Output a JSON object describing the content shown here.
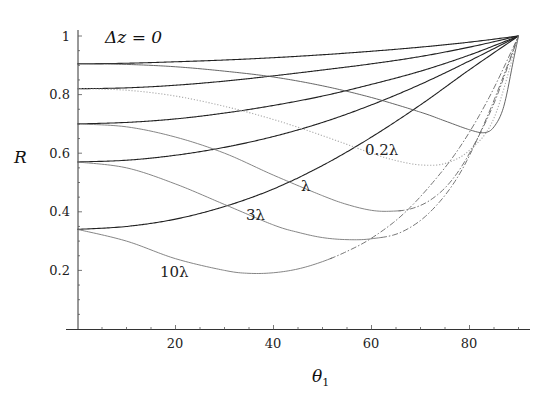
{
  "chart_data": {
    "type": "line",
    "title": "Δz = 0",
    "xlabel": "θ₁",
    "ylabel": "R",
    "xlim": [
      0,
      92
    ],
    "ylim": [
      0,
      1
    ],
    "grid": false,
    "legend": "none (inline curve labels)",
    "x_ticks": [
      20,
      40,
      60,
      80
    ],
    "x_tick_labels": [
      "20",
      "40",
      "60",
      "80"
    ],
    "x_minor_step": 5,
    "y_ticks": [
      0.2,
      0.4,
      0.6,
      0.8,
      1
    ],
    "y_tick_labels": [
      "0.2",
      "0.4",
      "0.6",
      "0.8",
      "1"
    ],
    "y_minor_step": 0.05,
    "annotations": [
      {
        "text": "0.2λ",
        "x": 59,
        "y": 0.61
      },
      {
        "text": "λ",
        "x": 46,
        "y": 0.48
      },
      {
        "text": "3λ",
        "x": 34.5,
        "y": 0.38
      },
      {
        "text": "10λ",
        "x": 17.5,
        "y": 0.19
      }
    ],
    "series": [
      {
        "name": "upper-1",
        "style": "solid",
        "color": "#222222",
        "x": [
          0,
          10,
          20,
          30,
          40,
          50,
          60,
          70,
          80,
          90
        ],
        "y": [
          0.905,
          0.907,
          0.912,
          0.918,
          0.926,
          0.936,
          0.948,
          0.962,
          0.979,
          1.0
        ]
      },
      {
        "name": "upper-2",
        "style": "solid",
        "color": "#222222",
        "x": [
          0,
          10,
          20,
          30,
          40,
          50,
          60,
          70,
          80,
          90
        ],
        "y": [
          0.82,
          0.823,
          0.832,
          0.846,
          0.864,
          0.884,
          0.905,
          0.93,
          0.962,
          1.0
        ]
      },
      {
        "name": "upper-3",
        "style": "solid",
        "color": "#222222",
        "x": [
          0,
          10,
          20,
          30,
          40,
          50,
          60,
          70,
          80,
          90
        ],
        "y": [
          0.7,
          0.705,
          0.717,
          0.737,
          0.763,
          0.795,
          0.835,
          0.88,
          0.935,
          1.0
        ]
      },
      {
        "name": "upper-4",
        "style": "solid",
        "color": "#222222",
        "x": [
          0,
          10,
          20,
          30,
          40,
          50,
          60,
          70,
          80,
          90
        ],
        "y": [
          0.57,
          0.576,
          0.593,
          0.62,
          0.657,
          0.705,
          0.765,
          0.835,
          0.915,
          1.0
        ]
      },
      {
        "name": "upper-5",
        "style": "solid",
        "color": "#222222",
        "x": [
          0,
          10,
          20,
          30,
          40,
          50,
          60,
          70,
          80,
          90
        ],
        "y": [
          0.34,
          0.35,
          0.375,
          0.418,
          0.478,
          0.558,
          0.655,
          0.765,
          0.885,
          1.0
        ]
      },
      {
        "name": "lower-0.2λ-a",
        "label": "",
        "style": "solid",
        "color": "#555555",
        "x": [
          0,
          10,
          20,
          30,
          40,
          50,
          60,
          70,
          75,
          80,
          83,
          85,
          87,
          89,
          90
        ],
        "y": [
          0.905,
          0.903,
          0.895,
          0.88,
          0.86,
          0.83,
          0.79,
          0.74,
          0.71,
          0.68,
          0.67,
          0.69,
          0.76,
          0.92,
          1.0
        ]
      },
      {
        "name": "lower-0.2λ",
        "label": "0.2λ",
        "style": "dotted",
        "color": "#aaaaaa",
        "x": [
          0,
          10,
          20,
          30,
          40,
          50,
          60,
          65,
          70,
          75,
          80,
          85,
          90
        ],
        "y": [
          0.82,
          0.815,
          0.795,
          0.76,
          0.715,
          0.66,
          0.6,
          0.575,
          0.56,
          0.565,
          0.61,
          0.72,
          1.0
        ]
      },
      {
        "name": "lower-λ",
        "label": "λ",
        "style": "solid",
        "color": "#777777",
        "x": [
          0,
          10,
          20,
          30,
          40,
          50,
          55,
          60,
          64,
          68,
          72,
          76,
          80,
          85,
          90
        ],
        "y": [
          0.7,
          0.69,
          0.655,
          0.6,
          0.525,
          0.455,
          0.425,
          0.405,
          0.402,
          0.41,
          0.44,
          0.5,
          0.6,
          0.77,
          1.0
        ]
      },
      {
        "name": "lower-3λ",
        "label": "3λ",
        "style": "solid",
        "color": "#777777",
        "x": [
          0,
          10,
          20,
          30,
          40,
          45,
          50,
          55,
          60,
          66,
          72,
          78,
          84,
          90
        ],
        "y": [
          0.57,
          0.55,
          0.495,
          0.425,
          0.355,
          0.33,
          0.312,
          0.305,
          0.308,
          0.33,
          0.4,
          0.53,
          0.74,
          1.0
        ]
      },
      {
        "name": "lower-10λ",
        "label": "10λ",
        "style": "solid",
        "color": "#777777",
        "x": [
          0,
          10,
          20,
          30,
          35,
          40,
          45,
          50,
          55,
          60,
          66,
          72,
          78,
          84,
          90
        ],
        "y": [
          0.34,
          0.3,
          0.24,
          0.2,
          0.19,
          0.192,
          0.205,
          0.23,
          0.265,
          0.31,
          0.385,
          0.49,
          0.62,
          0.79,
          1.0
        ]
      }
    ],
    "dashed_from_theta": {
      "lower-λ": 66,
      "lower-3λ": 62,
      "lower-10λ": 52
    }
  },
  "labels": {
    "title": "Δz = 0",
    "ylabel": "R",
    "xlabel_main": "θ",
    "xlabel_sub": "1",
    "y_ticks": [
      "1",
      "0.8",
      "0.6",
      "0.4",
      "0.2"
    ],
    "x_ticks": [
      "20",
      "40",
      "60",
      "80"
    ],
    "curve_02": "0.2λ",
    "curve_1": "λ",
    "curve_3": "3λ",
    "curve_10": "10λ"
  }
}
